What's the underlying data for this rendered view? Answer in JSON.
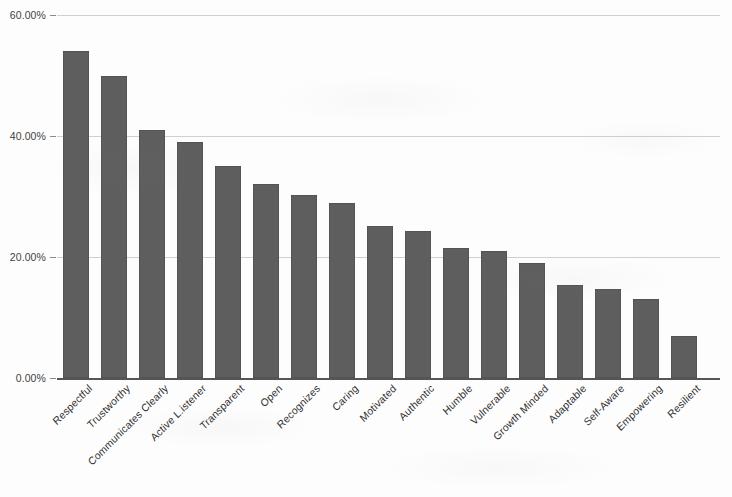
{
  "chart_data": {
    "type": "bar",
    "title": "",
    "subtitle": "",
    "xlabel": "",
    "ylabel": "",
    "ylim": [
      0,
      60
    ],
    "y_tick_labels": [
      "0.00%",
      "20.00%",
      "40.00%",
      "60.00%"
    ],
    "y_tick_values": [
      0,
      20,
      40,
      60
    ],
    "grid": "horizontal",
    "legend": "none",
    "value_suffix": "%",
    "bar_color": "#5e5e5e",
    "gridline_color": "#c8c8c8",
    "axis_color": "#555555",
    "background_color": "#fdfdfd",
    "categories": [
      "Respectful",
      "Trustworthy",
      "Communicates Clearly",
      "Active L.istener",
      "Transparent",
      "Open",
      "Recognizes",
      "Caring",
      "Motivated",
      "Authentic",
      "Humble",
      "Vulnerable",
      "Growth Minded",
      "Adaptable",
      "Self-Aware",
      "Empowering",
      "Resilient"
    ],
    "values": [
      54,
      50,
      41,
      39,
      35,
      32,
      30.2,
      29,
      25.2,
      24.3,
      21.5,
      21,
      19,
      15.3,
      14.7,
      13,
      7
    ]
  }
}
